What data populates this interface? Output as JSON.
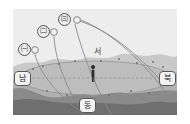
{
  "figure": {
    "kind": "celestial-sphere-star-paths-diagram",
    "plate": {
      "background_color": "#e9e9e9",
      "sky_color": "#ededed",
      "hill_color": "#c9c9c9",
      "ground_color": "#9e9e9e",
      "foreground_color": "#7c7c7c",
      "horizon_plane_color": "#bdbdbd",
      "path_color": "#8a8a8a",
      "dashed_line_color": "#9a9a9a"
    },
    "directions": [
      {
        "id": "south",
        "label": "남",
        "x": 14,
        "y": 78
      },
      {
        "id": "west",
        "label": "서",
        "x": 94,
        "y": 51,
        "style": "plain"
      },
      {
        "id": "north",
        "label": "북",
        "x": 156,
        "y": 78
      },
      {
        "id": "east",
        "label": "동",
        "x": 79,
        "y": 101
      }
    ],
    "star_markers": [
      {
        "id": "star-a",
        "label": "㈠",
        "x": 19,
        "y": 44,
        "path_id": "path-a"
      },
      {
        "id": "star-b",
        "label": "㈡",
        "x": 38,
        "y": 26,
        "path_id": "path-b"
      },
      {
        "id": "star-c",
        "label": "㈢",
        "x": 59,
        "y": 14,
        "path_id": "path-c"
      }
    ],
    "star_dots": [
      {
        "id": "dot-a",
        "x": 33,
        "y": 47
      },
      {
        "id": "dot-b",
        "x": 52,
        "y": 29
      },
      {
        "id": "dot-c",
        "x": 73,
        "y": 17
      }
    ],
    "observer": {
      "id": "observer-figure",
      "x": 93,
      "y": 73
    },
    "paths": [
      {
        "id": "path-a",
        "from": "㈠",
        "d": "M 33 52 C 38 74, 60 96, 84 112"
      },
      {
        "id": "path-b",
        "from": "㈡",
        "d": "M 52 34 C 52 62, 68 96, 86 118"
      },
      {
        "id": "path-c",
        "from": "㈢",
        "d": "M 73 22 C 80 54, 96 92, 112 120"
      },
      {
        "id": "path-d",
        "from": "㈢",
        "d": "M 78 17 C 110 30, 140 60, 162 92"
      }
    ],
    "horizon": {
      "id": "horizon-plane",
      "cx": 95,
      "cy": 78,
      "rx": 76,
      "ry": 17,
      "dashed_line": {
        "x1": 19,
        "y1": 78,
        "x2": 171,
        "y2": 78
      }
    }
  }
}
